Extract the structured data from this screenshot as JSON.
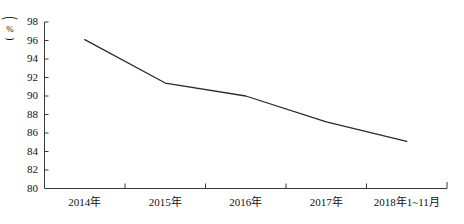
{
  "chart_data": {
    "type": "line",
    "title": "",
    "xlabel": "",
    "ylabel": "%",
    "y_axis_unit_label": "(%)",
    "categories": [
      "2014年",
      "2015年",
      "2016年",
      "2017年",
      "2018年1~11月"
    ],
    "values": [
      96.1,
      91.4,
      90.0,
      87.2,
      85.1
    ],
    "series": [
      {
        "name": "",
        "values": [
          96.1,
          91.4,
          90.0,
          87.2,
          85.1
        ]
      }
    ],
    "ylim": [
      80,
      98
    ],
    "y_ticks": [
      80,
      82,
      84,
      86,
      88,
      90,
      92,
      94,
      96,
      98
    ],
    "y_tick_labels": [
      "80",
      "82",
      "84",
      "86",
      "88",
      "90",
      "92",
      "94",
      "96",
      "98"
    ],
    "grid": false,
    "legend": false,
    "legend_position": "none",
    "line_color": "#2b2b2b",
    "axis_color": "#3a3a3a",
    "background": "#ffffff"
  },
  "axis": {
    "y_unit_open_paren": "⌒",
    "y_unit_symbol": "%",
    "y_unit_close_paren": "⌣"
  }
}
